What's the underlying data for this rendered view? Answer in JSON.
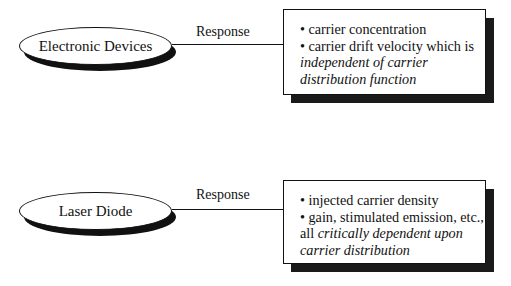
{
  "diagram": {
    "blocks": [
      {
        "node_label": "Electronic Devices",
        "connector_label": "Response",
        "box": {
          "lines": [
            {
              "normal": "• carrier concentration",
              "italic": ""
            },
            {
              "normal": "• carrier drift velocity which is",
              "italic": ""
            },
            {
              "normal": "",
              "italic": "independent of carrier"
            },
            {
              "normal": "",
              "italic": "distribution function"
            }
          ]
        }
      },
      {
        "node_label": "Laser Diode",
        "connector_label": "Response",
        "box": {
          "lines": [
            {
              "normal": "• injected carrier density",
              "italic": ""
            },
            {
              "normal": "• gain, stimulated emission, etc.,",
              "italic": ""
            },
            {
              "normal": "all ",
              "italic": "critically dependent upon"
            },
            {
              "normal": "",
              "italic": "carrier distribution"
            }
          ]
        }
      }
    ],
    "colors": {
      "stroke": "#111111",
      "shadow": "#1a1a1a",
      "background": "#ffffff"
    }
  }
}
